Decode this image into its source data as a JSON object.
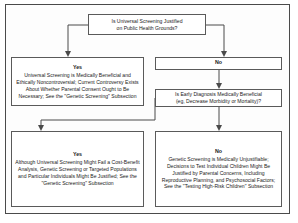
{
  "diagram": {
    "colors": {
      "frame": "#4a4a4a",
      "box_border": "#5a5a5a",
      "text": "#1a1a1a",
      "background": "#ffffff"
    },
    "nodes": {
      "root": {
        "id": "root-decision",
        "type": "decision",
        "line1": "Is Universal Screening Justified",
        "line2": "on Public Health Grounds?"
      },
      "yes_branch_1": {
        "id": "yes-branch-1",
        "type": "outcome",
        "label": "Yes",
        "text": "Universal Screening is Medically Beneficial and Ethically Noncontroversial; Current Controversy Exists About Whether Parental Consent Ought to Be Necessary; See the \"Genetic Screening\" Subsection"
      },
      "no_branch_1": {
        "id": "no-branch-1",
        "type": "label",
        "label": "No"
      },
      "decision_2": {
        "id": "second-decision",
        "type": "decision",
        "line1": "Is Early Diagnosis Medically Beneficial",
        "line2": "(eg, Decrease Morbidity or Mortality)?"
      },
      "yes_branch_2": {
        "id": "yes-branch-2",
        "type": "outcome",
        "label": "Yes",
        "text": "Although Universal Screening Might Fail a Cost-Benefit Analysis, Genetic Screening or Targeted Populations and Particular Individuals Might Be Justified; See the \"Genetic Screening\" Subsection"
      },
      "no_branch_2": {
        "id": "no-branch-2",
        "type": "outcome",
        "label": "No",
        "text": "Genetic Screening is Medically Unjustifiable; Decisions to Test Individual Children Might Be Justified by Parental Concerns, Including Reproductive Planning, and Psychosocial Factors; See the \"Testing High-Risk Children\" Subsection"
      }
    },
    "edges": [
      {
        "id": "root-to-yes",
        "from": "root-decision",
        "to": "yes-branch-1",
        "label": ""
      },
      {
        "id": "root-to-no",
        "from": "root-decision",
        "to": "no-branch-1",
        "label": ""
      },
      {
        "id": "no-to-decision2",
        "from": "no-branch-1",
        "to": "second-decision",
        "label": ""
      },
      {
        "id": "decision2-to-yes",
        "from": "second-decision",
        "to": "yes-branch-2",
        "label": ""
      },
      {
        "id": "decision2-to-no",
        "from": "second-decision",
        "to": "no-branch-2",
        "label": ""
      }
    ]
  }
}
